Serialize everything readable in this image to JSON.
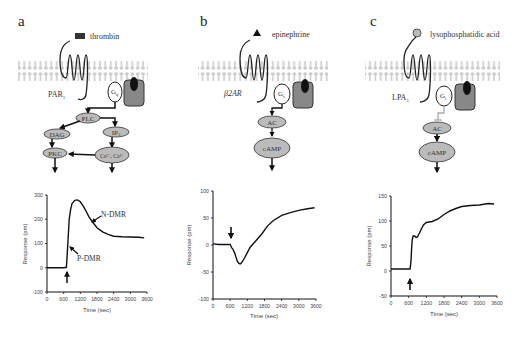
{
  "panels": [
    {
      "id": "a",
      "label": "a",
      "ligand": "thrombin",
      "ligand_shape": "dark-rectangle",
      "receptor": "PAR",
      "receptor_sub": "1",
      "g_protein": "G",
      "g_protein_sub": "q",
      "nodes": [
        {
          "id": "PLC",
          "label": "PLC"
        },
        {
          "id": "DAG",
          "label": "DAG"
        },
        {
          "id": "IP3",
          "label": "IP",
          "sub": "3"
        },
        {
          "id": "PKC",
          "label": "PKC"
        },
        {
          "id": "Ca",
          "label": "Ca²⁺, Ca²⁺"
        }
      ],
      "annotations": [
        "N-DMR",
        "P-DMR"
      ]
    },
    {
      "id": "b",
      "label": "b",
      "ligand": "epinephrine",
      "ligand_shape": "black-triangle",
      "receptor": "β2AR",
      "g_protein": "G",
      "g_protein_sub": "s",
      "nodes": [
        {
          "id": "AC",
          "label": "AC"
        },
        {
          "id": "cAMP",
          "label": "cAMP"
        }
      ]
    },
    {
      "id": "c",
      "label": "c",
      "ligand": "lysophosphatidic acid",
      "ligand_shape": "grey-circle",
      "receptor": "LPA",
      "receptor_sub": "1",
      "g_protein": "G",
      "g_protein_sub": "i",
      "nodes": [
        {
          "id": "AC",
          "label": "AC"
        },
        {
          "id": "cAMP",
          "label": "cAMP"
        }
      ]
    }
  ],
  "chart_data": [
    {
      "panel": "a",
      "type": "line",
      "title": "",
      "xlabel": "Time (sec)",
      "ylabel": "Response (pm)",
      "xlim": [
        0,
        3600
      ],
      "ylim": [
        -100,
        300
      ],
      "xticks": [
        0,
        600,
        1200,
        1800,
        2400,
        3000,
        3600
      ],
      "yticks": [
        -100,
        0,
        100,
        200,
        300
      ],
      "grid": false,
      "annotations": [
        {
          "text": "N-DMR",
          "x": 1500,
          "y": 200
        },
        {
          "text": "P-DMR",
          "x": 720,
          "y": 100
        },
        {
          "text": "stimulus-arrow",
          "x": 720
        }
      ],
      "x": [
        0,
        300,
        600,
        700,
        720,
        760,
        800,
        850,
        900,
        1000,
        1100,
        1200,
        1300,
        1400,
        1500,
        1600,
        1800,
        2000,
        2200,
        2400,
        2700,
        3000,
        3300,
        3500
      ],
      "y": [
        0,
        0,
        0,
        2,
        40,
        120,
        200,
        240,
        265,
        278,
        280,
        272,
        255,
        235,
        212,
        195,
        165,
        148,
        138,
        130,
        128,
        127,
        126,
        123
      ]
    },
    {
      "panel": "b",
      "type": "line",
      "title": "",
      "xlabel": "Time (sec)",
      "ylabel": "Response (pm)",
      "xlim": [
        0,
        3600
      ],
      "ylim": [
        -100,
        100
      ],
      "xticks": [
        0,
        600,
        1200,
        1800,
        2400,
        3000,
        3600
      ],
      "yticks": [
        -100,
        -50,
        0,
        50,
        100
      ],
      "grid": false,
      "annotations": [
        {
          "text": "stimulus-arrow",
          "x": 600
        }
      ],
      "x": [
        0,
        200,
        400,
        600,
        650,
        700,
        750,
        800,
        850,
        900,
        950,
        1000,
        1100,
        1200,
        1300,
        1500,
        1700,
        1900,
        2100,
        2400,
        2700,
        3000,
        3300,
        3550
      ],
      "y": [
        2,
        1,
        1,
        1,
        -5,
        -8,
        -14,
        -22,
        -30,
        -34,
        -35,
        -33,
        -24,
        -14,
        -4,
        8,
        20,
        35,
        45,
        55,
        60,
        64,
        67,
        69
      ]
    },
    {
      "panel": "c",
      "type": "line",
      "title": "",
      "xlabel": "Time (sec)",
      "ylabel": "Response (pm)",
      "xlim": [
        0,
        3600
      ],
      "ylim": [
        -50,
        150
      ],
      "xticks": [
        0,
        600,
        1200,
        1800,
        2400,
        3000,
        3600
      ],
      "yticks": [
        -50,
        0,
        50,
        100,
        150
      ],
      "grid": false,
      "annotations": [
        {
          "text": "stimulus-arrow",
          "x": 650
        }
      ],
      "x": [
        0,
        300,
        600,
        650,
        680,
        700,
        720,
        750,
        800,
        850,
        900,
        1000,
        1100,
        1200,
        1400,
        1600,
        1800,
        2000,
        2200,
        2400,
        2700,
        3000,
        3300,
        3500
      ],
      "y": [
        4,
        4,
        4,
        4,
        20,
        45,
        62,
        70,
        70,
        67,
        68,
        80,
        92,
        97,
        99,
        104,
        113,
        120,
        125,
        129,
        131,
        132,
        135,
        134
      ]
    }
  ]
}
